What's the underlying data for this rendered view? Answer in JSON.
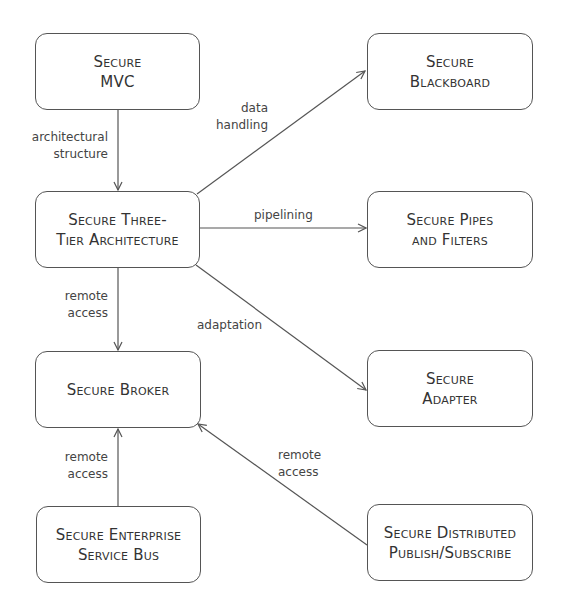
{
  "nodes": {
    "mvc": {
      "line1": "Secure",
      "line2": "MVC"
    },
    "three_tier": {
      "line1": "Secure Three-",
      "line2": "Tier Architecture"
    },
    "broker": {
      "line1": "Secure Broker"
    },
    "esb": {
      "line1": "Secure Enterprise",
      "line2": "Service Bus"
    },
    "blackboard": {
      "line1": "Secure",
      "line2": "Blackboard"
    },
    "pipes": {
      "line1": "Secure Pipes",
      "line2": "and Filters"
    },
    "adapter": {
      "line1": "Secure",
      "line2": "Adapter"
    },
    "dps": {
      "line1": "Secure Distributed",
      "line2": "Publish/Subscribe"
    }
  },
  "edges": {
    "mvc_to_three_tier": {
      "line1": "architectural",
      "line2": "structure"
    },
    "three_tier_to_blackboard": {
      "line1": "data",
      "line2": "handling"
    },
    "three_tier_to_pipes": {
      "line1": "pipelining"
    },
    "three_tier_to_broker": {
      "line1": "remote",
      "line2": "access"
    },
    "three_tier_to_adapter": {
      "line1": "adaptation"
    },
    "esb_to_broker": {
      "line1": "remote",
      "line2": "access"
    },
    "dps_to_broker": {
      "line1": "remote",
      "line2": "access"
    }
  },
  "colors": {
    "stroke": "#555555",
    "text": "#333333",
    "background": "#ffffff"
  }
}
